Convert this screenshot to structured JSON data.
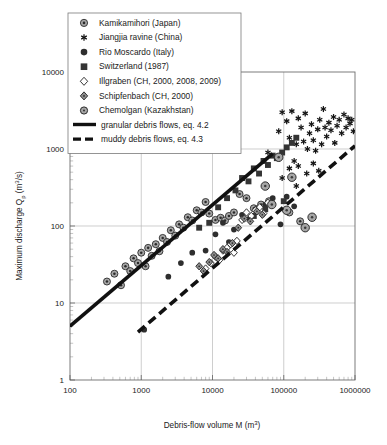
{
  "figure": {
    "background": "#ffffff",
    "frame_color": "#6e6e6e",
    "grid_color": "#b9b9b9"
  },
  "top_fragment": "",
  "legend": {
    "position": "top-left-inside",
    "entries": [
      {
        "label": "Kamikamihori (Japan)",
        "marker": "circle-target-gray",
        "color": "#9a9a9a"
      },
      {
        "label": "Jiangjia ravine (China)",
        "marker": "asterisk",
        "color": "#111111"
      },
      {
        "label": "Rio Moscardo (Italy)",
        "marker": "circle-filled-dark",
        "color": "#3a3a3a"
      },
      {
        "label": "Switzerland (1987)",
        "marker": "square-filled-dark",
        "color": "#3a3a3a"
      },
      {
        "label": "Illgraben (CH, 2000, 2008, 2009)",
        "marker": "diamond-open",
        "color": "#ffffff"
      },
      {
        "label": "Schipfenbach (CH, 2000)",
        "marker": "diamond-gray",
        "color": "#8e8e8e"
      },
      {
        "label": "Chemolgan (Kazakhstan)",
        "marker": "circle-gray",
        "color": "#a0a0a0"
      }
    ],
    "line_entries": [
      {
        "label": "granular debris flows, eq. 4.2",
        "style": "solid",
        "color": "#111111"
      },
      {
        "label": "muddy debris flows, eq. 4.3",
        "style": "dashed",
        "color": "#111111"
      }
    ]
  },
  "chart_data": {
    "type": "scatter",
    "title": "",
    "xlabel": "Debris-flow volume M (m³)",
    "ylabel": "Maximum discharge Qₚ (m³/s)",
    "xscale": "log",
    "yscale": "log",
    "xlim": [
      100,
      1000000
    ],
    "ylim": [
      1,
      10000
    ],
    "xticks": [
      100,
      1000,
      10000,
      100000,
      1000000
    ],
    "xtick_labels": [
      "100",
      "1000",
      "10000",
      "100000",
      "1000000"
    ],
    "yticks": [
      1,
      10,
      100,
      1000,
      10000
    ],
    "ytick_labels": [
      "1",
      "10",
      "100",
      "1000",
      "10000"
    ],
    "grid": true,
    "legend_position": "upper left",
    "series": [
      {
        "name": "Kamikamihori (Japan)",
        "marker": "circle-target-gray",
        "points": [
          [
            330,
            19
          ],
          [
            420,
            24
          ],
          [
            520,
            17
          ],
          [
            600,
            30
          ],
          [
            700,
            26
          ],
          [
            780,
            38
          ],
          [
            900,
            33
          ],
          [
            1000,
            45
          ],
          [
            1150,
            30
          ],
          [
            1250,
            52
          ],
          [
            1400,
            41
          ],
          [
            1600,
            58
          ],
          [
            1800,
            47
          ],
          [
            2000,
            70
          ],
          [
            2300,
            62
          ],
          [
            2600,
            88
          ],
          [
            3000,
            75
          ],
          [
            3400,
            105
          ],
          [
            3900,
            95
          ],
          [
            4500,
            130
          ],
          [
            5200,
            118
          ],
          [
            6000,
            160
          ],
          [
            7000,
            150
          ],
          [
            8000,
            205
          ],
          [
            9000,
            145
          ],
          [
            11000,
            120
          ],
          [
            13000,
            128
          ],
          [
            15000,
            118
          ],
          [
            17000,
            135
          ],
          [
            20000,
            150
          ],
          [
            24000,
            260
          ],
          [
            30000,
            230
          ],
          [
            38000,
            170
          ],
          [
            48000,
            190
          ],
          [
            62000,
            210
          ],
          [
            120000,
            150
          ],
          [
            170000,
            115
          ]
        ]
      },
      {
        "name": "Jiangjia ravine (China)",
        "marker": "asterisk",
        "points": [
          [
            60000,
            900
          ],
          [
            85000,
            1700
          ],
          [
            95000,
            3000
          ],
          [
            110000,
            2300
          ],
          [
            120000,
            1400
          ],
          [
            130000,
            3100
          ],
          [
            140000,
            700
          ],
          [
            150000,
            1150
          ],
          [
            160000,
            2500
          ],
          [
            175000,
            1900
          ],
          [
            190000,
            1250
          ],
          [
            200000,
            2900
          ],
          [
            215000,
            1000
          ],
          [
            230000,
            1600
          ],
          [
            245000,
            2100
          ],
          [
            260000,
            1300
          ],
          [
            280000,
            950
          ],
          [
            300000,
            1800
          ],
          [
            320000,
            2400
          ],
          [
            340000,
            1150
          ],
          [
            360000,
            3300
          ],
          [
            380000,
            1900
          ],
          [
            400000,
            1450
          ],
          [
            430000,
            2200
          ],
          [
            460000,
            1750
          ],
          [
            500000,
            2600
          ],
          [
            520000,
            1200
          ],
          [
            560000,
            2000
          ],
          [
            600000,
            2400
          ],
          [
            650000,
            1600
          ],
          [
            700000,
            2800
          ],
          [
            750000,
            1900
          ],
          [
            800000,
            2500
          ],
          [
            850000,
            2150
          ],
          [
            900000,
            2400
          ],
          [
            950000,
            1700
          ],
          [
            120000,
            560
          ],
          [
            160000,
            600
          ],
          [
            210000,
            480
          ],
          [
            260000,
            650
          ],
          [
            310000,
            520
          ],
          [
            95000,
            420
          ],
          [
            150000,
            330
          ]
        ]
      },
      {
        "name": "Rio Moscardo (Italy)",
        "marker": "circle-filled-dark",
        "points": [
          [
            1100,
            4.5
          ],
          [
            2400,
            22
          ],
          [
            3600,
            33
          ],
          [
            5200,
            45
          ],
          [
            8000,
            48
          ],
          [
            11000,
            78
          ],
          [
            14000,
            110
          ],
          [
            17000,
            62
          ],
          [
            20000,
            90
          ],
          [
            26000,
            140
          ],
          [
            33000,
            125
          ],
          [
            42000,
            170
          ],
          [
            55000,
            190
          ],
          [
            70000,
            230
          ],
          [
            90000,
            105
          ],
          [
            110000,
            240
          ],
          [
            140000,
            180
          ]
        ]
      },
      {
        "name": "Switzerland (1987)",
        "marker": "square-filled-dark",
        "points": [
          [
            6500,
            95
          ],
          [
            9000,
            110
          ],
          [
            12000,
            175
          ],
          [
            16000,
            230
          ],
          [
            21000,
            290
          ],
          [
            26000,
            420
          ],
          [
            32000,
            380
          ],
          [
            38000,
            560
          ],
          [
            45000,
            480
          ],
          [
            52000,
            700
          ],
          [
            60000,
            620
          ],
          [
            70000,
            820
          ],
          [
            80000,
            760
          ],
          [
            95000,
            900
          ],
          [
            110000,
            1050
          ],
          [
            130000,
            1200
          ],
          [
            150000,
            1400
          ],
          [
            38000,
            135
          ],
          [
            55000,
            165
          ],
          [
            100000,
            210
          ]
        ]
      },
      {
        "name": "Illgraben (CH, 2000, 2008, 2009)",
        "marker": "diamond-open",
        "points": [
          [
            8000,
            28
          ],
          [
            9500,
            33
          ],
          [
            11000,
            40
          ],
          [
            12500,
            36
          ],
          [
            14000,
            48
          ],
          [
            16000,
            52
          ],
          [
            18000,
            58
          ],
          [
            20000,
            45
          ],
          [
            22000,
            64
          ],
          [
            26000,
            120
          ],
          [
            30000,
            150
          ],
          [
            35000,
            135
          ],
          [
            40000,
            160
          ],
          [
            46000,
            175
          ],
          [
            52000,
            145
          ],
          [
            60000,
            200
          ]
        ]
      },
      {
        "name": "Schipfenbach (CH, 2000)",
        "marker": "diamond-gray",
        "points": [
          [
            6500,
            30
          ],
          [
            7500,
            26
          ],
          [
            9000,
            34
          ],
          [
            10500,
            42
          ],
          [
            12000,
            38
          ],
          [
            14000,
            50
          ],
          [
            16000,
            46
          ],
          [
            19000,
            60
          ],
          [
            23000,
            95
          ],
          [
            28000,
            125
          ],
          [
            34000,
            115
          ],
          [
            42000,
            155
          ],
          [
            50000,
            140
          ]
        ]
      },
      {
        "name": "Chemolgan (Kazakhstan)",
        "marker": "circle-gray",
        "points": [
          [
            55000,
            330
          ],
          [
            68000,
            190
          ],
          [
            85000,
            780
          ],
          [
            110000,
            160
          ],
          [
            130000,
            430
          ],
          [
            200000,
            95
          ],
          [
            250000,
            130
          ]
        ]
      }
    ],
    "lines": [
      {
        "name": "granular debris flows, eq. 4.2",
        "style": "solid",
        "width": 3.6,
        "color": "#111111",
        "from": [
          100,
          5.0
        ],
        "to": [
          70000,
          870
        ]
      },
      {
        "name": "muddy debris flows, eq. 4.3",
        "style": "dashed",
        "width": 3.6,
        "color": "#111111",
        "from": [
          900,
          4.2
        ],
        "to": [
          1000000,
          1100
        ]
      }
    ]
  }
}
